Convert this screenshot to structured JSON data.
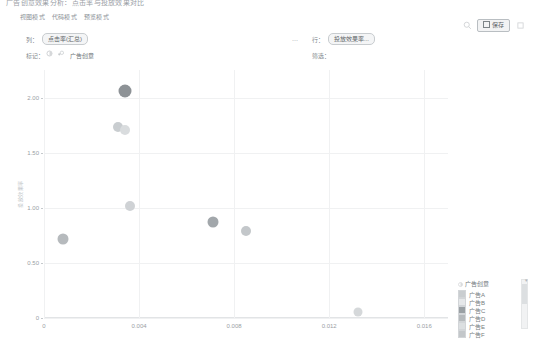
{
  "header": {
    "document_title": "广告创意效果分析：点击率与投放效果对比",
    "tabs": [
      "视图模式",
      "代码模式",
      "预览模式"
    ],
    "search_icon": "search-icon",
    "save_label": "保存",
    "more_icon": "more-options-icon"
  },
  "shelves": {
    "columns_label": "列：",
    "columns_pill": "点击率(汇总)",
    "marks_label": "标记：",
    "marks_pill": "广告创意",
    "marks_color_icon": "color-mark-icon",
    "marks_size_icon": "size-mark-icon",
    "rows_label": "行：",
    "rows_pill": "投放效果率...",
    "filters_label": "筛选：",
    "drag_handle": "drag-handle-icon"
  },
  "chart_data": {
    "type": "scatter",
    "title": "",
    "xlabel": "点击率",
    "ylabel": "投放效果率",
    "xlim": [
      0,
      0.017
    ],
    "ylim": [
      0,
      2.25
    ],
    "grid": true,
    "x_ticks": [
      0,
      0.004,
      0.008,
      0.012,
      0.016
    ],
    "x_tick_labels": [
      "0",
      "0.004",
      "0.008",
      "0.012",
      "0.016"
    ],
    "y_ticks": [
      0,
      0.5,
      1.0,
      1.5,
      2.0
    ],
    "y_tick_labels": [
      "0",
      "0.50",
      "1.00",
      "1.50",
      "2.00"
    ],
    "legend_title": "广告创意",
    "legend_position": "bottom-right",
    "series": [
      {
        "name": "广告A",
        "color": "#c9cdd0",
        "points": [
          {
            "x": 0.0031,
            "y": 1.73
          }
        ]
      },
      {
        "name": "广告B",
        "color": "#d9dcde",
        "points": [
          {
            "x": 0.0034,
            "y": 1.71
          }
        ]
      },
      {
        "name": "广告C",
        "color": "#8d9296",
        "points": [
          {
            "x": 0.0034,
            "y": 2.06
          }
        ]
      },
      {
        "name": "广告D",
        "color": "#b6babd",
        "points": [
          {
            "x": 0.0008,
            "y": 0.72
          }
        ]
      },
      {
        "name": "广告E",
        "color": "#cfd2d5",
        "points": [
          {
            "x": 0.0036,
            "y": 1.02
          }
        ]
      },
      {
        "name": "广告F",
        "color": "#a2a7ab",
        "points": [
          {
            "x": 0.0071,
            "y": 0.87
          }
        ]
      },
      {
        "name": "广告G",
        "color": "#c3c7ca",
        "points": [
          {
            "x": 0.0085,
            "y": 0.79
          }
        ]
      },
      {
        "name": "广告H",
        "color": "#d5d8da",
        "points": [
          {
            "x": 0.0132,
            "y": 0.05
          }
        ]
      }
    ],
    "legend_items": [
      {
        "label": "广告A",
        "color": "#c9cdd0"
      },
      {
        "label": "广告B",
        "color": "#e6e8ea"
      },
      {
        "label": "广告C",
        "color": "#9aa0a4"
      },
      {
        "label": "广告D",
        "color": "#b6babd"
      },
      {
        "label": "广告E",
        "color": "#dcdfe1"
      },
      {
        "label": "广告F",
        "color": "#c3c7ca"
      }
    ]
  }
}
